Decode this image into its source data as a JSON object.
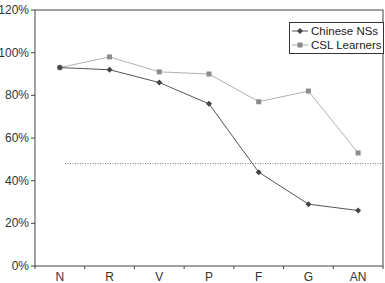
{
  "chart_data": {
    "type": "line",
    "title": "",
    "xlabel": "",
    "ylabel": "",
    "categories": [
      "N",
      "R",
      "V",
      "P",
      "F",
      "G",
      "AN"
    ],
    "series": [
      {
        "name": "Chinese NSs",
        "values": [
          93,
          92,
          86,
          76,
          44,
          29,
          26
        ],
        "color": "#555555",
        "marker": "diamond"
      },
      {
        "name": "CSL Learners",
        "values": [
          93,
          98,
          91,
          90,
          77,
          82,
          53
        ],
        "color": "#999999",
        "marker": "square"
      }
    ],
    "reference_line": {
      "value": 48,
      "style": "dotted",
      "color": "#777777"
    },
    "ylim": [
      0,
      120
    ],
    "yticks": [
      "0%",
      "20%",
      "40%",
      "60%",
      "80%",
      "100%",
      "120%"
    ],
    "grid": false,
    "legend_position": "upper right"
  },
  "legend": {
    "items": [
      {
        "label": "Chinese NSs"
      },
      {
        "label": "CSL Learners"
      }
    ]
  }
}
